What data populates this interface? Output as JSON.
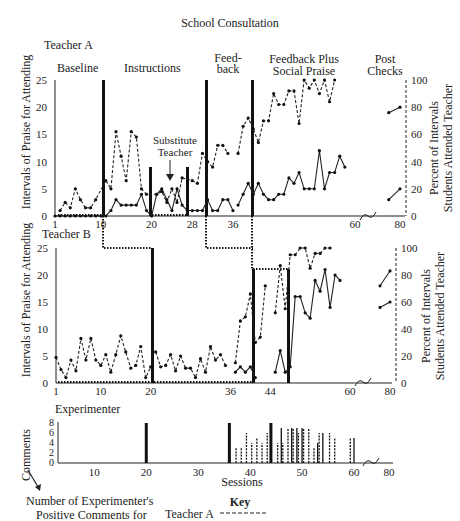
{
  "title": "School Consultation",
  "panels": {
    "teacher_a": {
      "label": "Teacher A"
    },
    "teacher_b": {
      "label": "Teacher B"
    },
    "experimenter": {
      "label": "Experimenter"
    }
  },
  "phases": {
    "baseline": "Baseline",
    "instructions": "Instructions",
    "substitute_line1": "Substitute",
    "substitute_line2": "Teacher",
    "feedback_line1": "Feed-",
    "feedback_line2": "back",
    "fbsp_line1": "Feedback Plus",
    "fbsp_line2": "Social Praise",
    "post_line1": "Post",
    "post_line2": "Checks"
  },
  "axes": {
    "left_label": "Intervals of Praise for Attending",
    "right_label_line1": "Percent of Intervals",
    "right_label_line2": "Students Attended Teacher",
    "comments_label": "Comments",
    "sessions_label": "Sessions",
    "left_ticks": [
      "25",
      "20",
      "15",
      "10",
      "5",
      "0"
    ],
    "right_ticks": [
      "100",
      "80",
      "60",
      "40",
      "20",
      "0"
    ],
    "comments_ticks": [
      "8",
      "6",
      "4",
      "2",
      "0"
    ],
    "a_x_ticks": [
      "1",
      "10",
      "20",
      "28",
      "36",
      "60",
      "80"
    ],
    "b_x_ticks": [
      "1",
      "10",
      "20",
      "36",
      "44",
      "60",
      "80"
    ],
    "exp_x_ticks": [
      "10",
      "20",
      "30",
      "40",
      "50",
      "60",
      "80"
    ]
  },
  "footnote": {
    "line1": "Number of Experimenter's",
    "line2": "Positive Comments for",
    "key_title": "Key",
    "key_teacher_a": "Teacher A"
  },
  "chart_data": [
    {
      "type": "line",
      "title": "Teacher A",
      "xlabel": "Sessions",
      "ylabel": "Intervals of Praise for Attending",
      "y2label": "Percent of Intervals Students Attended Teacher",
      "ylim": [
        0,
        25
      ],
      "y2lim": [
        0,
        100
      ],
      "phase_changes": [
        10,
        20,
        27,
        28,
        36
      ],
      "phases": [
        "Baseline",
        "Instructions",
        "Substitute Teacher",
        "Feedback",
        "Feedback Plus Social Praise",
        "Post Checks"
      ],
      "series": [
        {
          "name": "Praise intervals (solid, left axis)",
          "style": "solid",
          "axis": "left",
          "x": [
            1,
            2,
            3,
            4,
            5,
            6,
            7,
            8,
            9,
            10,
            11,
            12,
            13,
            14,
            15,
            16,
            17,
            18,
            19,
            20,
            21,
            22,
            23,
            24,
            25,
            26,
            27,
            28,
            29,
            30,
            31,
            32,
            33,
            34,
            35,
            36
          ],
          "y": [
            0,
            0,
            0,
            0,
            0,
            0,
            0,
            0,
            0,
            0,
            0,
            1,
            3,
            2,
            2,
            2,
            2,
            4,
            1,
            0,
            4,
            5,
            3,
            1,
            5,
            2,
            1,
            1,
            1,
            1,
            3,
            1,
            1,
            3,
            3,
            1
          ]
        },
        {
          "name": "Percent attended (dashed, right axis)",
          "style": "dashed",
          "axis": "right",
          "x": [
            2,
            3,
            4,
            5,
            6,
            7,
            8,
            9,
            11,
            12,
            13,
            14,
            15,
            16,
            17,
            18,
            19,
            21,
            22,
            23,
            24,
            25,
            26,
            28,
            29,
            30,
            31,
            32,
            33,
            34,
            35
          ],
          "y": [
            4,
            10,
            6,
            20,
            12,
            6,
            6,
            12,
            26,
            20,
            62,
            44,
            26,
            62,
            58,
            20,
            16,
            16,
            18,
            10,
            20,
            10,
            28,
            26,
            24,
            46,
            40,
            36,
            52,
            52,
            46
          ]
        },
        {
          "name": "Feedback+Praise percent (dashed, right axis)",
          "style": "dashed",
          "axis": "right",
          "x": [
            37,
            38,
            39,
            40,
            41,
            42,
            43,
            44,
            45,
            46,
            47,
            48,
            49,
            50,
            51,
            52,
            53,
            54,
            55,
            56,
            57,
            58,
            59,
            60
          ],
          "y": [
            46,
            66,
            72,
            64,
            54,
            70,
            70,
            90,
            82,
            82,
            92,
            92,
            68,
            100,
            94,
            100,
            90,
            100,
            84,
            100
          ]
        },
        {
          "name": "Feedback+Praise praise (solid, left axis)",
          "style": "solid",
          "axis": "left",
          "x": [
            37,
            38,
            39,
            40,
            41,
            42,
            43,
            44,
            45,
            46,
            47,
            48,
            49,
            50,
            51,
            52,
            53,
            54,
            55,
            56,
            57,
            58,
            59,
            60
          ],
          "y": [
            2,
            4,
            6,
            4,
            6,
            4,
            3,
            3,
            4,
            4,
            7,
            6,
            8,
            5,
            5,
            5,
            12,
            5,
            8,
            8,
            11,
            9
          ]
        },
        {
          "name": "Post check percent",
          "style": "solid",
          "axis": "right",
          "x": [
            75,
            80
          ],
          "y": [
            76,
            80
          ]
        },
        {
          "name": "Post check praise",
          "style": "solid",
          "axis": "left",
          "x": [
            75,
            80
          ],
          "y": [
            3,
            5
          ]
        }
      ]
    },
    {
      "type": "line",
      "title": "Teacher B",
      "xlabel": "Sessions",
      "ylabel": "Intervals of Praise for Attending",
      "y2label": "Percent of Intervals Students Attended Teacher",
      "ylim": [
        0,
        25
      ],
      "y2lim": [
        0,
        100
      ],
      "phase_changes": [
        20,
        36,
        44
      ],
      "series": [
        {
          "name": "Percent attended (mixed, right axis)",
          "style": "dashed",
          "axis": "right",
          "x": [
            1,
            2,
            3,
            4,
            5,
            6,
            7,
            8,
            9,
            10,
            11,
            12,
            13,
            14,
            15,
            16,
            17,
            18,
            19,
            20
          ],
          "y": [
            19,
            10,
            4,
            17,
            9,
            33,
            17,
            33,
            17,
            13,
            21,
            8,
            21,
            35,
            23,
            11,
            13,
            27,
            4,
            12
          ]
        },
        {
          "name": "Percent attended phase 2",
          "style": "dashed",
          "axis": "right",
          "x": [
            21,
            22,
            23,
            24,
            25,
            26,
            27,
            28,
            29,
            30,
            31,
            32,
            33,
            34,
            35
          ],
          "y": [
            23,
            12,
            13,
            21,
            9,
            20,
            11,
            11,
            4,
            18,
            8,
            27,
            17,
            21,
            13
          ]
        },
        {
          "name": "Feedback percent",
          "style": "dashed",
          "axis": "right",
          "x": [
            37,
            38,
            39,
            40,
            41,
            42,
            43
          ],
          "y": [
            15,
            46,
            49,
            66,
            30,
            34,
            72
          ]
        },
        {
          "name": "Feedback praise",
          "style": "solid",
          "axis": "left",
          "x": [
            37,
            38,
            39,
            40,
            41
          ],
          "y": [
            2,
            3,
            2,
            3,
            1
          ]
        },
        {
          "name": "FB+Praise percent",
          "style": "dashed",
          "axis": "right",
          "x": [
            45,
            46,
            47,
            48,
            49,
            50,
            51,
            52,
            53,
            54,
            55,
            56,
            57,
            58
          ],
          "y": [
            52,
            87,
            55,
            95,
            95,
            103,
            103,
            85,
            96,
            96,
            102,
            102
          ]
        },
        {
          "name": "FB+Praise praise",
          "style": "solid",
          "axis": "left",
          "x": [
            45,
            46,
            47,
            48,
            49,
            50,
            51,
            52,
            53,
            54,
            55,
            56,
            57,
            58
          ],
          "y": [
            2,
            6,
            2,
            3,
            16,
            16,
            13,
            12,
            19,
            17,
            21,
            14,
            20,
            19
          ]
        },
        {
          "name": "Post check percent",
          "style": "solid",
          "axis": "right",
          "x": [
            75,
            80
          ],
          "y": [
            72,
            83
          ]
        },
        {
          "name": "Post check praise",
          "style": "solid",
          "axis": "left",
          "x": [
            75,
            80
          ],
          "y": [
            14,
            15
          ]
        }
      ]
    },
    {
      "type": "bar",
      "title": "Experimenter",
      "xlabel": "Sessions",
      "ylabel": "Comments",
      "ylim": [
        0,
        8
      ],
      "series": [
        {
          "name": "Teacher A (dashed)",
          "x": [
            37,
            38,
            39,
            40,
            41,
            42,
            43,
            45,
            46,
            47,
            48,
            49,
            50,
            51,
            52,
            53,
            55,
            56,
            59
          ],
          "y": [
            3,
            3,
            6,
            4,
            5,
            4,
            6,
            4,
            4,
            7,
            7,
            6,
            7,
            7,
            3,
            6,
            6,
            5,
            5
          ]
        },
        {
          "name": "Teacher B (solid)",
          "x": [
            20,
            36,
            44,
            46,
            48,
            49,
            50,
            53,
            54,
            60
          ],
          "y": [
            8,
            8,
            8,
            7,
            7,
            7,
            7,
            4,
            6,
            5
          ]
        }
      ]
    }
  ]
}
